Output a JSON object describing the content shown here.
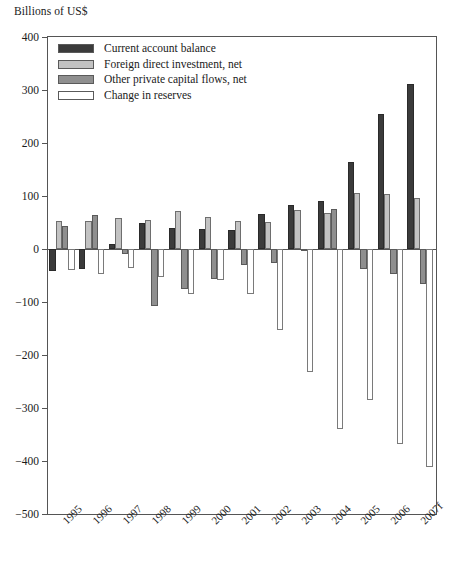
{
  "chart_data": {
    "type": "bar",
    "title": "",
    "subtitle": "",
    "ylabel": "Billions of US$",
    "xlabel": "",
    "ylim": [
      -500,
      400
    ],
    "yticks": [
      400,
      300,
      200,
      100,
      0,
      -100,
      -200,
      -300,
      -400,
      -500
    ],
    "ytick_labels": [
      "400",
      "300",
      "200",
      "100",
      "0",
      "−100",
      "−200",
      "−300",
      "−400",
      "−500"
    ],
    "grid": false,
    "legend_position": "top-left",
    "categories": [
      "1995",
      "1996",
      "1997",
      "1998",
      "1999",
      "2000",
      "2001",
      "2002",
      "2003",
      "2004",
      "2005",
      "2006",
      "2007f"
    ],
    "series": [
      {
        "name": "Current account balance",
        "color": "#3b3b3b",
        "values": [
          -41,
          -37,
          10,
          49,
          40,
          38,
          36,
          66,
          83,
          90,
          165,
          255,
          312
        ]
      },
      {
        "name": "Foreign direct investment, net",
        "color": "#c2c2c2",
        "values": [
          52,
          52,
          58,
          55,
          72,
          61,
          52,
          51,
          74,
          68,
          105,
          103,
          97
        ]
      },
      {
        "name": "Other private capital flows, net",
        "color": "#8f8f8f",
        "values": [
          44,
          64,
          -9,
          -108,
          -75,
          -56,
          -31,
          -27,
          -2,
          76,
          -38,
          -48,
          -66
        ]
      },
      {
        "name": "Change in reserves",
        "color": "#ffffff",
        "values": [
          -39,
          -47,
          -35,
          -53,
          -85,
          -59,
          -85,
          -153,
          -232,
          -339,
          -284,
          -367,
          -412
        ]
      }
    ]
  },
  "legend": {
    "items": [
      {
        "label": "Current account balance",
        "swatch": "#3b3b3b"
      },
      {
        "label": "Foreign direct investment, net",
        "swatch": "#c2c2c2"
      },
      {
        "label": "Other private capital flows, net",
        "swatch": "#8f8f8f"
      },
      {
        "label": "Change in reserves",
        "swatch": "#ffffff"
      }
    ]
  }
}
